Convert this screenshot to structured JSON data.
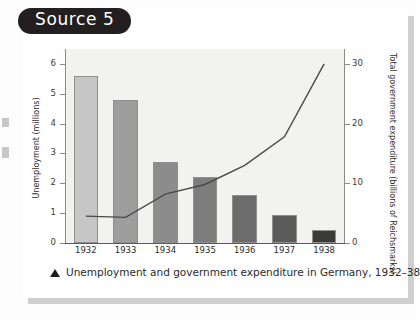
{
  "badge": {
    "label": "Source 5"
  },
  "caption": {
    "marker": "triangle-up",
    "text": "Unemployment and government expenditure in Germany, 1932–38"
  },
  "colors": {
    "badge_bg": "#231f20",
    "card_bg": "#ffffff",
    "plot_bg": "#f2f2f0",
    "line": "#4a4a4a",
    "axis": "#8a8a8a"
  },
  "chart_data": {
    "type": "bar",
    "title": "Unemployment and government expenditure in Germany, 1932–38",
    "categories": [
      "1932",
      "1933",
      "1934",
      "1935",
      "1936",
      "1937",
      "1938"
    ],
    "grid": false,
    "legend": "none",
    "series": [
      {
        "name": "Unemployment (millions)",
        "type": "bar",
        "axis": "left",
        "values": [
          5.6,
          4.8,
          2.7,
          2.2,
          1.6,
          0.95,
          0.43
        ],
        "colors": [
          "#c6c6c6",
          "#9d9d9d",
          "#8c8c8c",
          "#7d7d7d",
          "#6c6c6c",
          "#5b5b5b",
          "#3a3a3a"
        ]
      },
      {
        "name": "Total government expenditure (billions of Reichsmarks)",
        "type": "line",
        "axis": "right",
        "values": [
          4.5,
          4.3,
          8.2,
          9.8,
          13.0,
          17.8,
          30.0
        ]
      }
    ],
    "xlabel": "",
    "ylabel": "Unemployment (millions)",
    "ylabel_right": "Total government expenditure (billions of Reichsmarks)",
    "ylim": [
      0,
      6.5
    ],
    "ylim_right": [
      0,
      32.5
    ],
    "yticks": [
      "0",
      "1",
      "2",
      "3",
      "4",
      "5",
      "6"
    ],
    "ytick_values": [
      0,
      1,
      2,
      3,
      4,
      5,
      6
    ],
    "yticks_right": [
      "0",
      "10",
      "20",
      "30"
    ],
    "ytick_values_right": [
      0,
      10,
      20,
      30
    ]
  }
}
